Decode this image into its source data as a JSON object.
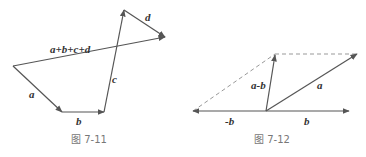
{
  "figures": [
    {
      "caption": "图 7-11",
      "labels": {
        "a": "a",
        "b": "b",
        "c": "c",
        "d": "d",
        "sum": "a+b+c+d"
      },
      "vectors": [
        {
          "name": "a",
          "from": [
            13,
            66
          ],
          "to": [
            62,
            112
          ]
        },
        {
          "name": "b",
          "from": [
            62,
            112
          ],
          "to": [
            104,
            112
          ]
        },
        {
          "name": "c",
          "from": [
            104,
            112
          ],
          "to": [
            124,
            10
          ]
        },
        {
          "name": "d",
          "from": [
            124,
            10
          ],
          "to": [
            165,
            37
          ]
        },
        {
          "name": "a+b+c+d",
          "from": [
            13,
            66
          ],
          "to": [
            165,
            37
          ]
        }
      ]
    },
    {
      "caption": "图 7-12",
      "labels": {
        "a": "a",
        "b": "b",
        "neg_b": "-b",
        "a_minus_b": "a-b"
      },
      "vectors": [
        {
          "name": "a",
          "from": [
            266,
            111
          ],
          "to": [
            357,
            54
          ]
        },
        {
          "name": "b",
          "from": [
            266,
            111
          ],
          "to": [
            349,
            111
          ]
        },
        {
          "name": "-b",
          "from": [
            266,
            111
          ],
          "to": [
            193,
            111
          ]
        },
        {
          "name": "a-b",
          "from": [
            266,
            111
          ],
          "to": [
            275,
            54
          ]
        }
      ],
      "dashed": [
        {
          "from": [
            193,
            111
          ],
          "to": [
            275,
            54
          ]
        },
        {
          "from": [
            275,
            54
          ],
          "to": [
            357,
            54
          ]
        }
      ]
    }
  ],
  "colors": {
    "line": "#555555",
    "dashed": "#999999",
    "caption": "#777777"
  }
}
